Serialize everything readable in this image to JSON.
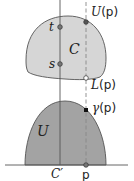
{
  "diagram": {
    "regions": {
      "upper": {
        "label": "C",
        "fill": "#d6d6d6",
        "stroke": "#555555"
      },
      "lower": {
        "label": "U",
        "fill": "#a3a3a3",
        "stroke": "#555555"
      }
    },
    "points": {
      "t": {
        "label": "t"
      },
      "s": {
        "label": "s"
      },
      "upper_bound": {
        "label_var": "U",
        "label_arg": "(p)"
      },
      "lower_bound": {
        "label_var": "L",
        "label_arg": "(p)"
      },
      "gamma": {
        "label_var": "γ",
        "label_arg": "(p)"
      },
      "p": {
        "label": "p"
      }
    },
    "axis": {
      "c_prime_label": "C′"
    },
    "colors": {
      "line": "#555555",
      "dashed": "#888888",
      "point_fill_grey": "#777777",
      "point_fill_black": "#111111",
      "point_fill_white": "#ffffff"
    }
  }
}
